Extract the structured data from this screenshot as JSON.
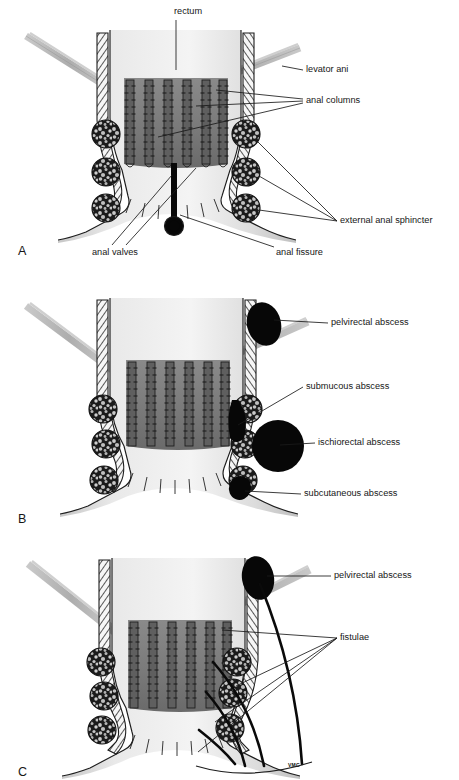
{
  "figure": {
    "type": "medical-illustration",
    "background_color": "#ffffff",
    "signature": "VMC"
  },
  "panels": [
    {
      "id": "A",
      "letter": "A",
      "subject": "Normal anorectal anatomy with anal fissure",
      "labels": [
        {
          "name": "rectum",
          "text": "rectum",
          "x": 174,
          "y": 12,
          "anchor": "start"
        },
        {
          "name": "levator-ani",
          "text": "levator ani",
          "x": 306,
          "y": 70,
          "anchor": "start"
        },
        {
          "name": "anal-columns",
          "text": "anal columns",
          "x": 306,
          "y": 101,
          "anchor": "start"
        },
        {
          "name": "external-anal-sphincter",
          "text": "external anal sphincter",
          "x": 340,
          "y": 221,
          "anchor": "start"
        },
        {
          "name": "anal-valves",
          "text": "anal valves",
          "x": 92,
          "y": 253,
          "anchor": "start"
        },
        {
          "name": "anal-fissure",
          "text": "anal fissure",
          "x": 276,
          "y": 253,
          "anchor": "start"
        }
      ]
    },
    {
      "id": "B",
      "letter": "B",
      "subject": "Sites of anorectal abscesses",
      "labels": [
        {
          "name": "pelvirectal-abscess",
          "text": "pelvirectal abscess",
          "x": 331,
          "y": 323,
          "anchor": "start"
        },
        {
          "name": "submucous-abscess",
          "text": "submucous abscess",
          "x": 306,
          "y": 387,
          "anchor": "start"
        },
        {
          "name": "ischiorectal-abscess",
          "text": "ischiorectal abscess",
          "x": 318,
          "y": 443,
          "anchor": "start"
        },
        {
          "name": "subcutaneous-abscess",
          "text": "subcutaneous abscess",
          "x": 304,
          "y": 494,
          "anchor": "start"
        }
      ]
    },
    {
      "id": "C",
      "letter": "C",
      "subject": "Anorectal fistulae",
      "labels": [
        {
          "name": "pelvirectal-abscess",
          "text": "pelvirectal abscess",
          "x": 334,
          "y": 576,
          "anchor": "start"
        },
        {
          "name": "fistulae",
          "text": "fistulae",
          "x": 340,
          "y": 638,
          "anchor": "start"
        }
      ]
    }
  ],
  "colors": {
    "outline": "#1d1d1d",
    "lumen_light": "#f2f2f2",
    "lumen_mid": "#c9c9c9",
    "mucosa_dark": "#7b7b7b",
    "column_dark": "#6e6e6e",
    "sphincter_fill": "#3d3d3d",
    "abscess": "#070707",
    "levator": "#b6b6b6",
    "hatch": "#2a2a2a",
    "text": "#161616"
  },
  "structures": {
    "anal_columns_count": 6,
    "external_sphincter_circles_per_side": 3,
    "fistula_tracts": 3,
    "abscess_count_panel_b": 4
  }
}
